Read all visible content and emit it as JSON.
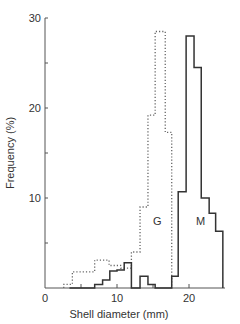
{
  "chart_data": {
    "type": "bar",
    "subtype": "step-histogram",
    "title": "",
    "xlabel": "Shell diameter (mm)",
    "ylabel": "Frequency (%)",
    "xlim": [
      0,
      25
    ],
    "ylim": [
      0,
      30
    ],
    "x_ticks": [
      0,
      5,
      10,
      15,
      20
    ],
    "x_tick_labels": [
      "0",
      "10",
      "20"
    ],
    "y_ticks": [
      0,
      5,
      10,
      15,
      20,
      25,
      30
    ],
    "y_tick_labels": [
      "10",
      "20",
      "30"
    ],
    "grid": false,
    "legend": "inline labels",
    "series": [
      {
        "name": "G",
        "style": "dotted",
        "bin_edges": [
          2.6,
          3.8,
          6.9,
          8.9,
          10.5,
          12,
          13.2,
          14.3,
          15.3,
          16.7,
          17.6
        ],
        "values": [
          0.4,
          1.8,
          3.1,
          2.5,
          2.2,
          4.0,
          9.0,
          19.2,
          28.5,
          17.3
        ]
      },
      {
        "name": "M",
        "style": "solid",
        "bin_edges": [
          3.4,
          6.9,
          8.0,
          9.0,
          10.0,
          11.0,
          12.0,
          13.2,
          14.3,
          15.3,
          17.6,
          18.5,
          19.6,
          20.7,
          21.7,
          22.8,
          23.7,
          24.7
        ],
        "values": [
          0.0,
          0.4,
          0.9,
          1.9,
          2.0,
          2.8,
          0.0,
          1.3,
          0.4,
          0.0,
          1.3,
          10.7,
          28.0,
          24.5,
          10.0,
          8.3,
          6.3
        ]
      }
    ],
    "annotations": [
      {
        "text": "G",
        "x": 15.6,
        "y": 7
      },
      {
        "text": "M",
        "x": 21.6,
        "y": 7
      }
    ]
  }
}
